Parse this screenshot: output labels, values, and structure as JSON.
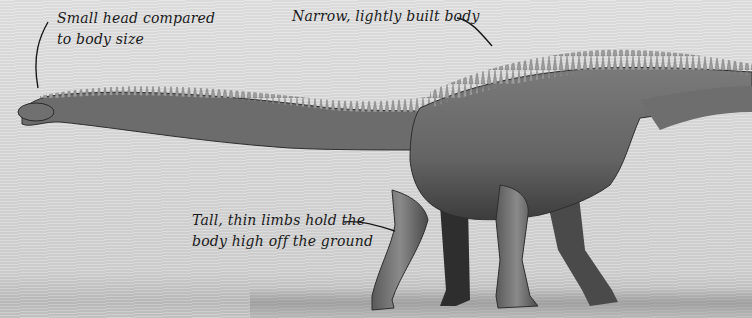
{
  "illustration": {
    "subject": "sauropod dinosaur side view",
    "style": "grayscale pencil sketch",
    "colors": {
      "background": "#d9d9d9",
      "body": "#6e6e6e",
      "body_dark": "#3a3a3a",
      "spines": "#9a9a9a",
      "ink": "#1a1a1a"
    }
  },
  "annotations": [
    {
      "id": "head",
      "lines": [
        "Small head compared",
        "to body size"
      ]
    },
    {
      "id": "body",
      "lines": [
        "Narrow, lightly built body"
      ]
    },
    {
      "id": "limbs",
      "lines": [
        "Tall, thin limbs hold the",
        "body high off the ground"
      ]
    }
  ]
}
